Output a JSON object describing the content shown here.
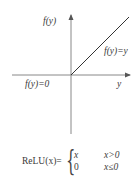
{
  "diagram": {
    "y_axis_label": "f(y)",
    "x_axis_label": "y",
    "positive_branch_label": "f(y)=y",
    "negative_branch_label": "f(y)=0",
    "colors": {
      "axis": "#888888",
      "line": "#333333"
    }
  },
  "formula": {
    "name": "ReLU(x)=",
    "cases": [
      {
        "value": "x",
        "condition": "x>0"
      },
      {
        "value": "0",
        "condition": "x≤0"
      }
    ]
  }
}
